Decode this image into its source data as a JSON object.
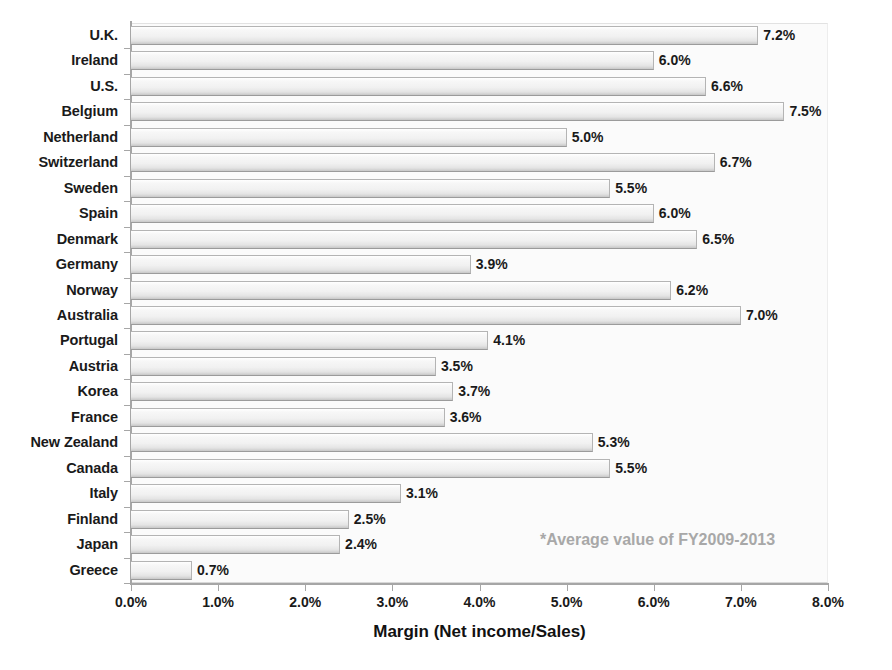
{
  "chart_data": {
    "type": "bar",
    "orientation": "horizontal",
    "title": "",
    "xlabel": "Margin (Net income/Sales)",
    "ylabel": "",
    "xlim": [
      0.0,
      8.0
    ],
    "xtick_labels": [
      "0.0%",
      "1.0%",
      "2.0%",
      "3.0%",
      "4.0%",
      "5.0%",
      "6.0%",
      "7.0%",
      "8.0%"
    ],
    "xtick_values": [
      0.0,
      1.0,
      2.0,
      3.0,
      4.0,
      5.0,
      6.0,
      7.0,
      8.0
    ],
    "grid": false,
    "legend": null,
    "annotation": "*Average value of FY2009-2013",
    "unit": "%",
    "categories": [
      "U.K.",
      "Ireland",
      "U.S.",
      "Belgium",
      "Netherland",
      "Switzerland",
      "Sweden",
      "Spain",
      "Denmark",
      "Germany",
      "Norway",
      "Australia",
      "Portugal",
      "Austria",
      "Korea",
      "France",
      "New Zealand",
      "Canada",
      "Italy",
      "Finland",
      "Japan",
      "Greece"
    ],
    "values": [
      7.2,
      6.0,
      6.6,
      7.5,
      5.0,
      6.7,
      5.5,
      6.0,
      6.5,
      3.9,
      6.2,
      7.0,
      4.1,
      3.5,
      3.7,
      3.6,
      5.3,
      5.5,
      3.1,
      2.5,
      2.4,
      0.7
    ],
    "value_labels": [
      "7.2%",
      "6.0%",
      "6.6%",
      "7.5%",
      "5.0%",
      "6.7%",
      "5.5%",
      "6.0%",
      "6.5%",
      "3.9%",
      "6.2%",
      "7.0%",
      "4.1%",
      "3.5%",
      "3.7%",
      "3.6%",
      "5.3%",
      "5.5%",
      "3.1%",
      "2.5%",
      "2.4%",
      "0.7%"
    ],
    "colors": {
      "bar_fill": "#f1f1f1",
      "bar_edge": "#b4b4b4",
      "plot_background": "#fbfbfb",
      "axis": "#a6a6a6",
      "text": "#1a1a1a",
      "annotation": "#a8a8a8"
    }
  }
}
